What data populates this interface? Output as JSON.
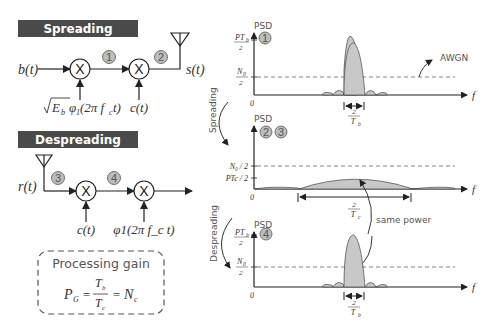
{
  "left": {
    "spreading": {
      "header": "Spreading",
      "input": "b(t)",
      "carrier": "√E_b φ1(2π f_c t)",
      "carrier_parts": {
        "sqrt": "E",
        "sub_b": "b",
        "phi": "φ",
        "one": "1",
        "arg": "(2π f",
        "c": "c",
        "t": "t)"
      },
      "code": "c(t)",
      "output": "s(t)",
      "step1": "1",
      "step2": "2"
    },
    "despreading": {
      "header": "Despreading",
      "input": "r(t)",
      "code": "c(t)",
      "carrier": "φ1(2π f_c t)",
      "step3": "3",
      "step4": "4"
    },
    "processing_gain": {
      "title": "Processing gain",
      "pg": "P",
      "pg_sub": "G",
      "num": "T",
      "num_sub": "b",
      "den": "T",
      "den_sub": "c",
      "eq": "=",
      "nc": "N",
      "nc_sub": "c"
    }
  },
  "right": {
    "arrow_spreading": "Spreading",
    "arrow_despreading": "Despreading",
    "plot1": {
      "ylabel": "PSD",
      "step": "1",
      "y_top_num": "PT",
      "y_top_sub": "b",
      "y_top_den": "2",
      "y_noise_num": "N",
      "y_noise_sub": "0",
      "y_noise_den": "2",
      "origin": "0",
      "xlabel": "f",
      "bw_num": "2",
      "bw_den": "T",
      "bw_sub": "b",
      "annotation": "AWGN"
    },
    "plot2": {
      "ylabel": "PSD",
      "steps": [
        "2",
        "3"
      ],
      "y_noise": "N₀ / 2",
      "y_signal": "PTc / 2",
      "origin": "0",
      "xlabel": "f",
      "bw_num": "2",
      "bw_den": "T",
      "bw_sub": "c",
      "annotation": "same power"
    },
    "plot3": {
      "ylabel": "PSD",
      "step": "4",
      "y_top_num": "PT",
      "y_top_sub": "b",
      "y_top_den": "2",
      "y_noise_num": "N",
      "y_noise_sub": "0",
      "y_noise_den": "2",
      "origin": "0",
      "xlabel": "f",
      "bw_num": "2",
      "bw_den": "T",
      "bw_sub": "b"
    }
  },
  "colors": {
    "header_bg": "#4a4a4a",
    "header_fg": "#ffffff",
    "circle_fill": "#bdbdbd",
    "spectrum_fill": "#c8c8c8",
    "line": "#333333",
    "dash": "#777777"
  }
}
